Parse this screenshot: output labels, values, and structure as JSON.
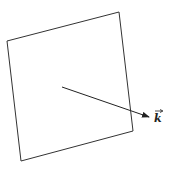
{
  "diagram": {
    "plane": {
      "points": [
        [
          7,
          41
        ],
        [
          119,
          12
        ],
        [
          133,
          131
        ],
        [
          21,
          161
        ]
      ],
      "stroke": "#333333"
    },
    "vector": {
      "from": [
        62,
        87
      ],
      "to": [
        149,
        117
      ],
      "label": "k",
      "label_arrow": "→",
      "stroke": "#222222"
    }
  }
}
